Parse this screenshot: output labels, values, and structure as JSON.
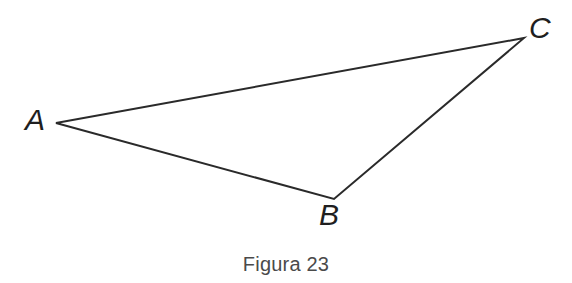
{
  "figure": {
    "caption": "Figura 23",
    "background_color": "#ffffff",
    "stroke_color": "#2a2a2a",
    "label_color": "#1f1f1f",
    "caption_color": "#4a4a4a",
    "stroke_width": 2
  },
  "labels": {
    "a": "A",
    "b": "B",
    "c": "C"
  },
  "chart_data": {
    "type": "diagram",
    "shape": "triangle",
    "title": "Figura 23",
    "xlabel": "",
    "ylabel": "",
    "vertices": [
      {
        "name": "A",
        "x": 56,
        "y": 123,
        "label": "A",
        "label_x": 38,
        "label_y": 121
      },
      {
        "name": "B",
        "x": 334,
        "y": 199,
        "label": "B",
        "label_x": 333,
        "label_y": 216
      },
      {
        "name": "C",
        "x": 524,
        "y": 38,
        "label": "C",
        "label_x": 541,
        "label_y": 29
      }
    ],
    "edges": [
      {
        "from": "A",
        "to": "C"
      },
      {
        "from": "A",
        "to": "B"
      },
      {
        "from": "B",
        "to": "C"
      }
    ],
    "xlim": [
      0,
      572
    ],
    "ylim": [
      283,
      0
    ],
    "grid": false,
    "legend": false
  }
}
